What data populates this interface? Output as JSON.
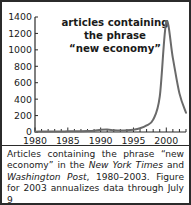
{
  "figure": {
    "title_lines": [
      "articles containing",
      "the phrase",
      "“new economy”"
    ],
    "caption_parts": {
      "p1": "Articles containing the phrase “new economy” in the ",
      "i1": "New York Times",
      "p2": " and ",
      "i2": "Washington Post",
      "p3": ", 1980–2003. Figure for 2003 annualizes data through July 9"
    },
    "colors": {
      "line": "#6a6a6a",
      "axis": "#2b2b2b",
      "border": "#2b2b2b",
      "background": "#ffffff",
      "text": "#1a1a1a"
    }
  },
  "chart_data": {
    "type": "line",
    "title": "articles containing the phrase “new economy”",
    "xlabel": "",
    "ylabel": "",
    "xlim": [
      1980,
      2003
    ],
    "ylim": [
      0,
      1400
    ],
    "ytick_labels": [
      "0",
      "200",
      "400",
      "600",
      "800",
      "1000",
      "1200",
      "1400"
    ],
    "yticks": [
      0,
      200,
      400,
      600,
      800,
      1000,
      1200,
      1400
    ],
    "xtick_labels": [
      "1980",
      "1985",
      "1990",
      "1995",
      "2000"
    ],
    "xticks": [
      1980,
      1985,
      1990,
      1995,
      2000
    ],
    "xminor_step": 1,
    "grid": false,
    "legend": false,
    "x": [
      1980,
      1981,
      1982,
      1983,
      1984,
      1985,
      1986,
      1987,
      1988,
      1989,
      1990,
      1991,
      1992,
      1993,
      1994,
      1995,
      1996,
      1997,
      1998,
      1999,
      2000,
      2001,
      2002,
      2003
    ],
    "values": [
      4,
      5,
      6,
      6,
      7,
      8,
      9,
      10,
      12,
      16,
      26,
      30,
      22,
      18,
      20,
      28,
      45,
      80,
      150,
      430,
      1340,
      900,
      470,
      235
    ]
  }
}
